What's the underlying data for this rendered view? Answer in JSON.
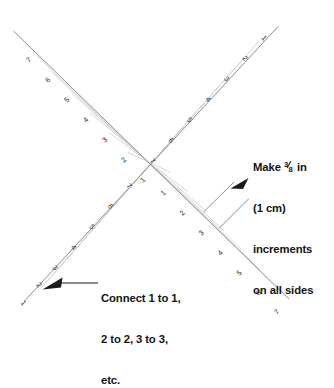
{
  "figure": {
    "background_color": "#ffffff",
    "axis_color": "#8e8e92",
    "stitch_color": "#d2d2d6",
    "text_color": "#141414"
  },
  "callouts": {
    "increments": {
      "line1_prefix": "Make ",
      "fraction_numerator": "3",
      "fraction_denominator": "8",
      "line1_suffix": " in",
      "line2": "(1 cm)",
      "line3": "increments",
      "line4": "on all sides"
    },
    "connect": {
      "line1": "Connect 1 to 1,",
      "line2": "2 to 2, 3 to 3,",
      "line3": "etc."
    }
  },
  "axes": [
    {
      "name": "upper-left-arm",
      "labels": [
        "1",
        "2",
        "3",
        "4",
        "5",
        "6",
        "7"
      ],
      "direction": "up-left from center"
    },
    {
      "name": "lower-right-arm",
      "labels": [
        "1",
        "2",
        "3",
        "4",
        "5",
        "6",
        "7"
      ],
      "direction": "down-right from center"
    },
    {
      "name": "upper-right-arm",
      "labels": [
        "1",
        "2",
        "3",
        "4",
        "5",
        "6",
        "7"
      ],
      "direction": "up-right from center"
    },
    {
      "name": "lower-left-arm",
      "labels": [
        "1",
        "2",
        "3",
        "4",
        "5",
        "6",
        "7"
      ],
      "direction": "down-left from center"
    }
  ],
  "tick_numbers": {
    "upper_left": [
      "7",
      "6",
      "5",
      "4",
      "3",
      "2",
      "1"
    ],
    "lower_right": [
      "1",
      "2",
      "3",
      "4",
      "5",
      "6",
      "7"
    ],
    "upper_right": [
      "1",
      "2",
      "3",
      "4",
      "5",
      "6",
      "7"
    ],
    "lower_left": [
      "7",
      "6",
      "5",
      "4",
      "3",
      "2",
      "1"
    ]
  },
  "increment_marks": {
    "count": 2,
    "description": "two short parallel bracket strokes spanning one increment"
  }
}
